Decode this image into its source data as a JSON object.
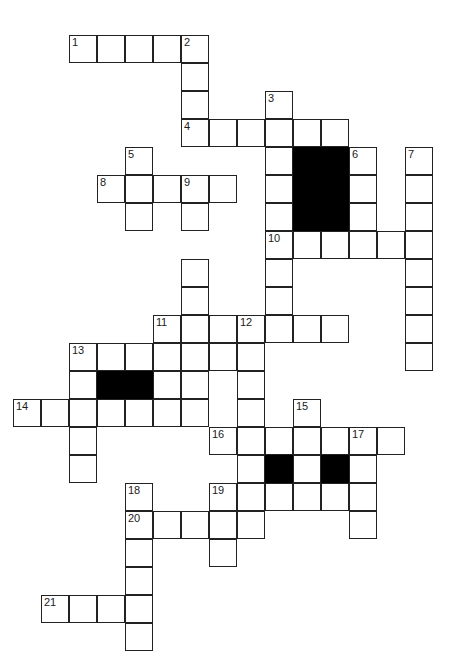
{
  "puzzle": {
    "type": "crossword-grid",
    "title": "Crossword Puzzle Grid",
    "cell_size": 28,
    "origin_x": 13,
    "origin_y": 35,
    "columns": 16,
    "rows": 22,
    "colors": {
      "background": "#ffffff",
      "cell_fill": "#ffffff",
      "cell_border": "#222222",
      "block_fill": "#000000",
      "number_color": "#1a1a1a"
    },
    "clue_count": 21,
    "clue_numbers": [
      "1",
      "2",
      "3",
      "4",
      "5",
      "6",
      "7",
      "8",
      "9",
      "10",
      "11",
      "12",
      "13",
      "14",
      "15",
      "16",
      "17",
      "18",
      "19",
      "20",
      "21"
    ],
    "cells": [
      {
        "c": 2,
        "r": 0,
        "n": "1"
      },
      {
        "c": 3,
        "r": 0,
        "n": ""
      },
      {
        "c": 4,
        "r": 0,
        "n": ""
      },
      {
        "c": 5,
        "r": 0,
        "n": ""
      },
      {
        "c": 6,
        "r": 0,
        "n": "2"
      },
      {
        "c": 6,
        "r": 1,
        "n": ""
      },
      {
        "c": 6,
        "r": 2,
        "n": ""
      },
      {
        "c": 9,
        "r": 2,
        "n": "3"
      },
      {
        "c": 6,
        "r": 3,
        "n": "4"
      },
      {
        "c": 7,
        "r": 3,
        "n": ""
      },
      {
        "c": 8,
        "r": 3,
        "n": ""
      },
      {
        "c": 9,
        "r": 3,
        "n": ""
      },
      {
        "c": 10,
        "r": 3,
        "n": ""
      },
      {
        "c": 11,
        "r": 3,
        "n": ""
      },
      {
        "c": 4,
        "r": 4,
        "n": "5"
      },
      {
        "c": 9,
        "r": 4,
        "n": ""
      },
      {
        "c": 10,
        "r": 4,
        "n": "",
        "block": true
      },
      {
        "c": 11,
        "r": 4,
        "n": "",
        "block": true
      },
      {
        "c": 12,
        "r": 4,
        "n": "6"
      },
      {
        "c": 14,
        "r": 4,
        "n": "7"
      },
      {
        "c": 3,
        "r": 5,
        "n": "8"
      },
      {
        "c": 4,
        "r": 5,
        "n": ""
      },
      {
        "c": 5,
        "r": 5,
        "n": ""
      },
      {
        "c": 6,
        "r": 5,
        "n": "9"
      },
      {
        "c": 7,
        "r": 5,
        "n": ""
      },
      {
        "c": 9,
        "r": 5,
        "n": ""
      },
      {
        "c": 10,
        "r": 5,
        "n": "",
        "block": true
      },
      {
        "c": 11,
        "r": 5,
        "n": "",
        "block": true
      },
      {
        "c": 12,
        "r": 5,
        "n": ""
      },
      {
        "c": 14,
        "r": 5,
        "n": ""
      },
      {
        "c": 4,
        "r": 6,
        "n": ""
      },
      {
        "c": 6,
        "r": 6,
        "n": ""
      },
      {
        "c": 9,
        "r": 6,
        "n": ""
      },
      {
        "c": 10,
        "r": 6,
        "n": "",
        "block": true
      },
      {
        "c": 11,
        "r": 6,
        "n": "",
        "block": true
      },
      {
        "c": 12,
        "r": 6,
        "n": ""
      },
      {
        "c": 14,
        "r": 6,
        "n": ""
      },
      {
        "c": 9,
        "r": 7,
        "n": "10"
      },
      {
        "c": 10,
        "r": 7,
        "n": ""
      },
      {
        "c": 11,
        "r": 7,
        "n": ""
      },
      {
        "c": 12,
        "r": 7,
        "n": ""
      },
      {
        "c": 13,
        "r": 7,
        "n": ""
      },
      {
        "c": 14,
        "r": 7,
        "n": ""
      },
      {
        "c": 6,
        "r": 8,
        "n": ""
      },
      {
        "c": 9,
        "r": 8,
        "n": ""
      },
      {
        "c": 14,
        "r": 8,
        "n": ""
      },
      {
        "c": 6,
        "r": 9,
        "n": ""
      },
      {
        "c": 9,
        "r": 9,
        "n": ""
      },
      {
        "c": 14,
        "r": 9,
        "n": ""
      },
      {
        "c": 5,
        "r": 10,
        "n": "11"
      },
      {
        "c": 6,
        "r": 10,
        "n": ""
      },
      {
        "c": 7,
        "r": 10,
        "n": ""
      },
      {
        "c": 8,
        "r": 10,
        "n": "12"
      },
      {
        "c": 9,
        "r": 10,
        "n": ""
      },
      {
        "c": 10,
        "r": 10,
        "n": ""
      },
      {
        "c": 11,
        "r": 10,
        "n": ""
      },
      {
        "c": 14,
        "r": 10,
        "n": ""
      },
      {
        "c": 2,
        "r": 11,
        "n": "13"
      },
      {
        "c": 3,
        "r": 11,
        "n": ""
      },
      {
        "c": 4,
        "r": 11,
        "n": ""
      },
      {
        "c": 5,
        "r": 11,
        "n": ""
      },
      {
        "c": 6,
        "r": 11,
        "n": ""
      },
      {
        "c": 7,
        "r": 11,
        "n": ""
      },
      {
        "c": 8,
        "r": 11,
        "n": ""
      },
      {
        "c": 14,
        "r": 11,
        "n": ""
      },
      {
        "c": 2,
        "r": 12,
        "n": ""
      },
      {
        "c": 3,
        "r": 12,
        "n": "",
        "block": true
      },
      {
        "c": 4,
        "r": 12,
        "n": "",
        "block": true
      },
      {
        "c": 5,
        "r": 12,
        "n": ""
      },
      {
        "c": 6,
        "r": 12,
        "n": ""
      },
      {
        "c": 8,
        "r": 12,
        "n": ""
      },
      {
        "c": 0,
        "r": 13,
        "n": "14"
      },
      {
        "c": 1,
        "r": 13,
        "n": ""
      },
      {
        "c": 2,
        "r": 13,
        "n": ""
      },
      {
        "c": 3,
        "r": 13,
        "n": ""
      },
      {
        "c": 4,
        "r": 13,
        "n": ""
      },
      {
        "c": 5,
        "r": 13,
        "n": ""
      },
      {
        "c": 6,
        "r": 13,
        "n": ""
      },
      {
        "c": 8,
        "r": 13,
        "n": ""
      },
      {
        "c": 10,
        "r": 13,
        "n": "15"
      },
      {
        "c": 2,
        "r": 14,
        "n": ""
      },
      {
        "c": 7,
        "r": 14,
        "n": "16"
      },
      {
        "c": 8,
        "r": 14,
        "n": ""
      },
      {
        "c": 9,
        "r": 14,
        "n": ""
      },
      {
        "c": 10,
        "r": 14,
        "n": ""
      },
      {
        "c": 11,
        "r": 14,
        "n": ""
      },
      {
        "c": 12,
        "r": 14,
        "n": "17"
      },
      {
        "c": 13,
        "r": 14,
        "n": ""
      },
      {
        "c": 2,
        "r": 15,
        "n": ""
      },
      {
        "c": 8,
        "r": 15,
        "n": ""
      },
      {
        "c": 9,
        "r": 15,
        "n": "",
        "block": true
      },
      {
        "c": 10,
        "r": 15,
        "n": ""
      },
      {
        "c": 11,
        "r": 15,
        "n": "",
        "block": true
      },
      {
        "c": 12,
        "r": 15,
        "n": ""
      },
      {
        "c": 4,
        "r": 16,
        "n": "18"
      },
      {
        "c": 7,
        "r": 16,
        "n": "19"
      },
      {
        "c": 8,
        "r": 16,
        "n": ""
      },
      {
        "c": 9,
        "r": 16,
        "n": ""
      },
      {
        "c": 10,
        "r": 16,
        "n": ""
      },
      {
        "c": 11,
        "r": 16,
        "n": ""
      },
      {
        "c": 12,
        "r": 16,
        "n": ""
      },
      {
        "c": 4,
        "r": 17,
        "n": "20"
      },
      {
        "c": 5,
        "r": 17,
        "n": ""
      },
      {
        "c": 6,
        "r": 17,
        "n": ""
      },
      {
        "c": 7,
        "r": 17,
        "n": ""
      },
      {
        "c": 8,
        "r": 17,
        "n": ""
      },
      {
        "c": 12,
        "r": 17,
        "n": ""
      },
      {
        "c": 4,
        "r": 18,
        "n": ""
      },
      {
        "c": 7,
        "r": 18,
        "n": ""
      },
      {
        "c": 4,
        "r": 19,
        "n": ""
      },
      {
        "c": 1,
        "r": 20,
        "n": "21"
      },
      {
        "c": 2,
        "r": 20,
        "n": ""
      },
      {
        "c": 3,
        "r": 20,
        "n": ""
      },
      {
        "c": 4,
        "r": 20,
        "n": ""
      },
      {
        "c": 4,
        "r": 21,
        "n": ""
      }
    ]
  }
}
